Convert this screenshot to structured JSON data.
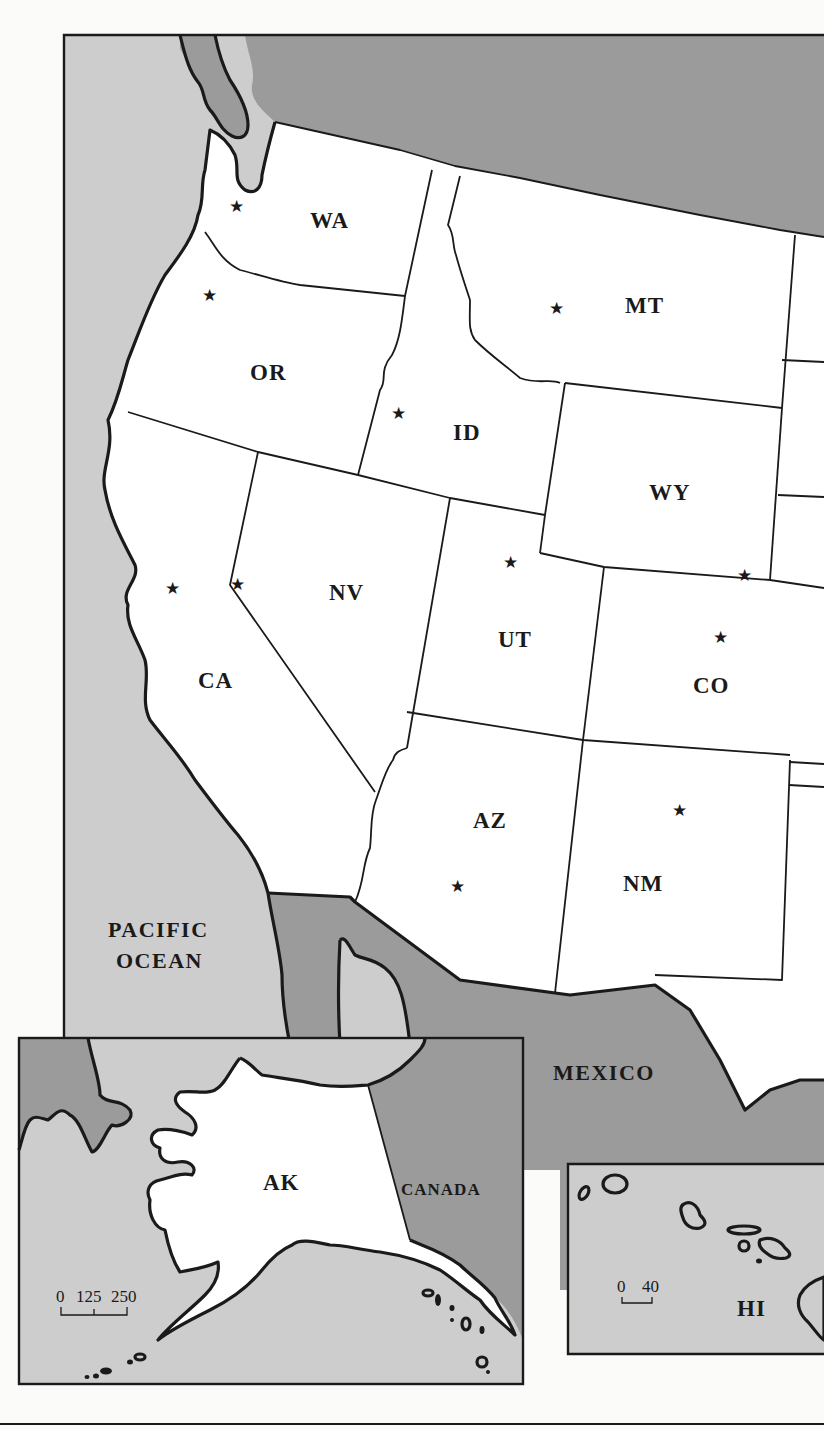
{
  "map": {
    "title": "",
    "colors": {
      "ocean": "#cdcdcd",
      "foreign_land": "#9b9b9b",
      "us_land": "#ffffff",
      "lines": "#1a1a1a"
    },
    "states": [
      {
        "code": "WA",
        "has_capital_star": true
      },
      {
        "code": "OR",
        "has_capital_star": true
      },
      {
        "code": "ID",
        "has_capital_star": true
      },
      {
        "code": "MT",
        "has_capital_star": true
      },
      {
        "code": "WY",
        "has_capital_star": true
      },
      {
        "code": "CA",
        "has_capital_star": true
      },
      {
        "code": "NV",
        "has_capital_star": true
      },
      {
        "code": "UT",
        "has_capital_star": true
      },
      {
        "code": "CO",
        "has_capital_star": true
      },
      {
        "code": "AZ",
        "has_capital_star": true
      },
      {
        "code": "NM",
        "has_capital_star": true
      }
    ],
    "regions": {
      "ocean": "PACIFIC",
      "ocean_line2": "OCEAN",
      "south": "MEXICO"
    },
    "capital_symbol": "★",
    "insets": {
      "alaska": {
        "state": "AK",
        "neighbor": "CANADA",
        "scale": {
          "ticks": [
            "0",
            "125",
            "250"
          ]
        }
      },
      "hawaii": {
        "state": "HI",
        "scale": {
          "ticks": [
            "0",
            "40"
          ]
        }
      }
    }
  }
}
